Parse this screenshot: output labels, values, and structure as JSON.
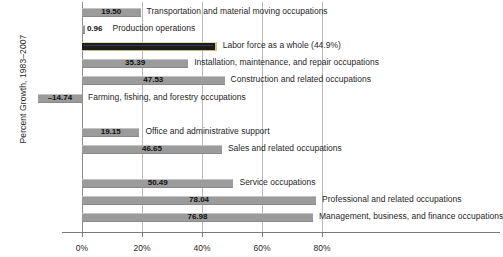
{
  "chart_data": {
    "type": "bar",
    "orientation": "horizontal",
    "title": "",
    "subtitle": "",
    "xlabel": "",
    "ylabel": "Percent Growth, 1983–2007",
    "xlim": [
      -20,
      90
    ],
    "xticks": [
      0,
      20,
      40,
      60,
      80
    ],
    "xticklabels": [
      "0%",
      "20%",
      "40%",
      "60%",
      "80%"
    ],
    "grid": true,
    "legend": false,
    "value_label_format": "two-decimal",
    "highlight_color": "#1c1c1c",
    "bar_color": "#9b9b9b",
    "categories": [
      "Transportation and material moving occupations",
      "Production operations",
      "Labor force as a whole (44.9%)",
      "Installation, maintenance, and repair occupations",
      "Construction and related occupations",
      "Farming, fishing, and forestry occupations",
      "Office and administrative support",
      "Sales and related occupations",
      "Service occupations",
      "Professional and related occupations",
      "Management, business, and finance occupations"
    ],
    "values": [
      19.5,
      0.96,
      44.9,
      35.39,
      47.53,
      -14.74,
      19.15,
      46.65,
      50.49,
      78.04,
      76.98
    ],
    "value_labels": [
      "19.50",
      "0.96",
      "",
      "35.39",
      "47.53",
      "–14.74",
      "19.15",
      "46.65",
      "50.49",
      "78.04",
      "76.98"
    ],
    "highlight_index": 2,
    "bars": [
      {
        "label": "Transportation and material moving occupations",
        "value": 19.5,
        "value_label": "19.50",
        "highlight": false,
        "row": 0
      },
      {
        "label": "Production operations",
        "value": 0.96,
        "value_label": "0.96",
        "highlight": false,
        "row": 1
      },
      {
        "label": "Labor force as a whole (44.9%)",
        "value": 44.9,
        "value_label": "",
        "highlight": true,
        "row": 2
      },
      {
        "label": "Installation, maintenance, and repair occupations",
        "value": 35.39,
        "value_label": "35.39",
        "highlight": false,
        "row": 3
      },
      {
        "label": "Construction and related occupations",
        "value": 47.53,
        "value_label": "47.53",
        "highlight": false,
        "row": 4
      },
      {
        "label": "Farming, fishing, and forestry occupations",
        "value": -14.74,
        "value_label": "–14.74",
        "highlight": false,
        "row": 5
      },
      {
        "label": "Office and administrative support",
        "value": 19.15,
        "value_label": "19.15",
        "highlight": false,
        "row": 7
      },
      {
        "label": "Sales and related occupations",
        "value": 46.65,
        "value_label": "46.65",
        "highlight": false,
        "row": 8
      },
      {
        "label": "Service occupations",
        "value": 50.49,
        "value_label": "50.49",
        "highlight": false,
        "row": 10
      },
      {
        "label": "Professional and related occupations",
        "value": 78.04,
        "value_label": "78.04",
        "highlight": false,
        "row": 11
      },
      {
        "label": "Management, business, and finance occupations",
        "value": 76.98,
        "value_label": "76.98",
        "highlight": false,
        "row": 12
      }
    ]
  }
}
